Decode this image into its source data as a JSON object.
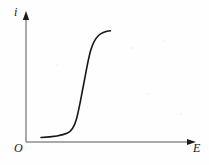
{
  "figure": {
    "type": "line-plot",
    "background_color": "#fefefe",
    "ink_color": "#161616",
    "origin_label": "O",
    "y_axis_label": "i",
    "x_axis_label": "E"
  },
  "chart_data": {
    "type": "line",
    "title": "",
    "subtitle": "",
    "xlabel": "E",
    "ylabel": "i",
    "grid": false,
    "legend": null,
    "annotations": [],
    "axis": {
      "x_origin_px": 26,
      "y_origin_px": 142,
      "x_axis_end_px": 196,
      "y_axis_end_px": 14,
      "x_arrowhead": true,
      "y_arrowhead": true,
      "tick_labels_x": [],
      "tick_labels_y": [],
      "xlim": [
        0,
        1
      ],
      "ylim": [
        0,
        1
      ]
    },
    "series": [
      {
        "name": "polarization-curve",
        "shape": "sigmoid",
        "color": "#161616",
        "line_width": 1.6,
        "x": [
          0.085,
          0.15,
          0.21,
          0.255,
          0.275,
          0.29,
          0.3,
          0.315,
          0.335,
          0.36,
          0.39,
          0.42,
          0.45,
          0.475,
          0.5,
          0.52,
          0.545,
          0.575,
          0.61,
          0.65,
          0.69,
          0.72,
          0.75,
          0.8,
          0.86,
          0.92,
          0.98
        ],
        "y": [
          0.04,
          0.042,
          0.048,
          0.06,
          0.08,
          0.11,
          0.145,
          0.2,
          0.265,
          0.33,
          0.4,
          0.465,
          0.525,
          0.58,
          0.635,
          0.68,
          0.725,
          0.77,
          0.815,
          0.855,
          0.88,
          0.895,
          0.905,
          0.915,
          0.92,
          0.922,
          0.923
        ],
        "path_px": "M 41,137.5 C 52,137 61,136 67.5,133 C 72,131 74.5,126 76.5,119 C 79,110 81,98 83.5,85 C 86,72 88,60 90.5,51 C 92.5,44 95,39 98.5,35.5 C 102,32.5 106,31.2 110.5,30.8"
      }
    ]
  },
  "labels": {
    "origin": "O",
    "y_axis": "i",
    "x_axis": "E"
  }
}
